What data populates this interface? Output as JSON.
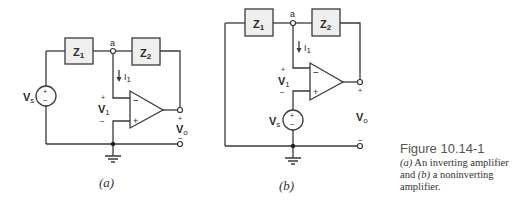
{
  "circuit_a": {
    "caption": "(a)",
    "z1": {
      "main": "Z",
      "sub": "1"
    },
    "z2": {
      "main": "Z",
      "sub": "2"
    },
    "node_label": "a",
    "current": {
      "main": "I",
      "sub": "1"
    },
    "source": {
      "main": "V",
      "sub": "s",
      "plus": "+",
      "minus": "−"
    },
    "v1": {
      "main": "V",
      "sub": "1",
      "plus": "+",
      "minus": "−"
    },
    "vo": {
      "main": "V",
      "sub": "o",
      "plus": "+",
      "minus": "−"
    },
    "opamp": {
      "inv": "−",
      "noninv": "+"
    }
  },
  "circuit_b": {
    "caption": "(b)",
    "z1": {
      "main": "Z",
      "sub": "1"
    },
    "z2": {
      "main": "Z",
      "sub": "2"
    },
    "node_label": "a",
    "current": {
      "main": "I",
      "sub": "1"
    },
    "source": {
      "main": "V",
      "sub": "s",
      "plus": "+",
      "minus": "−"
    },
    "v1": {
      "main": "V",
      "sub": "1",
      "plus": "+",
      "minus": "−"
    },
    "vo": {
      "main": "V",
      "sub": "o",
      "plus": "+",
      "minus": "−"
    },
    "opamp": {
      "inv": "−",
      "noninv": "+"
    }
  },
  "figure": {
    "title": "Figure 10.14-1",
    "desc_a_label": "(a)",
    "desc_a_text": " An inverting amplifier and ",
    "desc_b_label": "(b)",
    "desc_b_text": " a noninverting amplifier."
  }
}
